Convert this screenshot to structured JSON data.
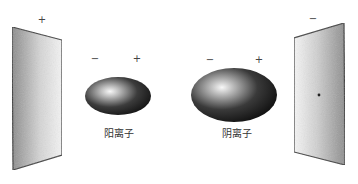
{
  "diagram": {
    "type": "ion-polarization-between-charged-plates",
    "left_plate": {
      "charge_sign": "+",
      "points": "12,27 62,40 62,155 13,170"
    },
    "right_plate": {
      "charge_sign": "−",
      "points": "294,38 344,23 345,165 294,152"
    },
    "ions": [
      {
        "label": "阳离子",
        "left_sign": "−",
        "right_sign": "+",
        "cx": 118,
        "cy": 96,
        "rx": 33,
        "ry": 19
      },
      {
        "label": "阴离子",
        "left_sign": "−",
        "right_sign": "+",
        "cx": 234,
        "cy": 95,
        "rx": 43,
        "ry": 27
      }
    ],
    "colors": {
      "plate_edge": "#3a3a3a",
      "plate_dark": "#8a8a8a",
      "plate_light": "#f2f2f2",
      "ion_dark": "#111111",
      "ion_highlight": "#f5f5f5"
    }
  }
}
